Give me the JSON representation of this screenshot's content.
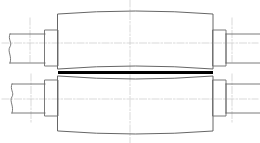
{
  "document": {
    "title": "Crowned Roller Assembly — Two-Half Sectional View",
    "background_color": "#ffffff",
    "width": 260,
    "height": 143
  },
  "style": {
    "outline_color": "#6b6b6b",
    "outline_color_dark": "#555555",
    "split_line_color": "#000000",
    "centerline_color": "#c8c8c8",
    "construction_line_color": "#d2d2d2",
    "outline_width": 0.9,
    "split_line_width": 3.2,
    "centerline_width": 0.7
  },
  "views": [
    {
      "name": "upper-half-view",
      "label": "Upper half",
      "body": {
        "name": "crowned-roller-body",
        "left_x": 58,
        "right_x": 213,
        "top_y": 14,
        "bottom_y": 69,
        "crown_bulge": 6,
        "crown_direction": "convex-up"
      },
      "collars": [
        {
          "name": "left-collar",
          "x": 45,
          "y": 30,
          "width": 13,
          "height": 36
        },
        {
          "name": "right-collar",
          "x": 213,
          "y": 30,
          "width": 13,
          "height": 36
        }
      ],
      "shafts": [
        {
          "name": "left-shaft",
          "x": 10,
          "y": 34,
          "width": 35,
          "height": 29,
          "break_end": "left"
        },
        {
          "name": "right-shaft",
          "x": 226,
          "y": 34,
          "width": 34,
          "height": 29,
          "break_end": "right"
        }
      ],
      "centerline_y": 43
    },
    {
      "name": "lower-half-view",
      "label": "Lower half",
      "body": {
        "name": "crowned-roller-body",
        "left_x": 58,
        "right_x": 213,
        "top_y": 76,
        "bottom_y": 131,
        "crown_bulge": 6,
        "crown_direction": "convex-down"
      },
      "collars": [
        {
          "name": "left-collar",
          "x": 45,
          "y": 80,
          "width": 13,
          "height": 36
        },
        {
          "name": "right-collar",
          "x": 213,
          "y": 80,
          "width": 13,
          "height": 36
        }
      ],
      "shafts": [
        {
          "name": "left-shaft",
          "x": 12,
          "y": 84,
          "width": 33,
          "height": 29,
          "break_end": "left"
        },
        {
          "name": "right-shaft",
          "x": 226,
          "y": 84,
          "width": 34,
          "height": 29,
          "break_end": "right"
        }
      ],
      "centerline_y": 99
    }
  ],
  "split_line": {
    "name": "parting-split-line",
    "x1": 58,
    "x2": 213,
    "y": 72.5
  },
  "centerlines": {
    "vertical": [
      {
        "name": "main-vertical-centerline",
        "x": 130,
        "y1": 0,
        "y2": 143
      },
      {
        "name": "left-shaft-vertical-centerline",
        "x": 30,
        "y1": 18,
        "y2": 62
      },
      {
        "name": "left-shaft-vertical-centerline-lower",
        "x": 31,
        "y1": 74,
        "y2": 122
      },
      {
        "name": "right-shaft-vertical-centerline",
        "x": 232,
        "y1": 18,
        "y2": 62
      },
      {
        "name": "right-shaft-vertical-centerline-lower",
        "x": 232,
        "y1": 74,
        "y2": 122
      }
    ],
    "horizontal": [
      {
        "name": "upper-axis-centerline",
        "y": 43,
        "x1": 2,
        "x2": 258
      },
      {
        "name": "lower-axis-centerline",
        "y": 99,
        "x1": 2,
        "x2": 258
      }
    ]
  }
}
